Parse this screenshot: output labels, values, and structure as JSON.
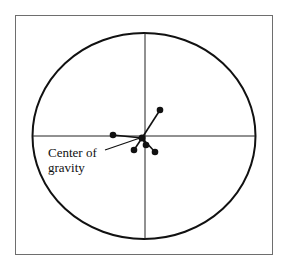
{
  "diagram": {
    "type": "target-scatter",
    "label": "Center of\ngravity",
    "colors": {
      "stroke": "#111111",
      "frame": "#6e6e6e",
      "background": "#ffffff"
    },
    "ellipse": {
      "cx": 144,
      "cy": 136,
      "rx": 111.5,
      "ry": 103
    },
    "center_of_gravity": {
      "x": 142,
      "y": 138
    },
    "points": [
      {
        "x": 160,
        "y": 110
      },
      {
        "x": 113,
        "y": 135
      },
      {
        "x": 134,
        "y": 150
      },
      {
        "x": 146,
        "y": 145
      },
      {
        "x": 155,
        "y": 152
      }
    ]
  }
}
